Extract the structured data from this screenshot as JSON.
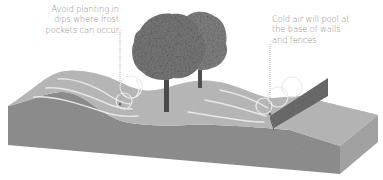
{
  "diagram": {
    "annotations": [
      {
        "id": "frost-pocket",
        "lines": [
          "Avoid planting in",
          "dips where frost",
          "pockets can occur"
        ]
      },
      {
        "id": "cold-air",
        "lines": [
          "Cold air will pool at",
          "the base of walls",
          "and fences"
        ]
      }
    ],
    "colors": {
      "background": "#ffffff",
      "ground_top": "#b9b9b9",
      "ground_front": "#8e8e8e",
      "ground_side": "#a4a4a4",
      "airflow_lines": "#e6e6e6",
      "wall_face": "#6f6f6f",
      "wall_top": "#8a8a8a",
      "leader_line": "#9a9a9a",
      "label_text": "#8c8c8c",
      "tree_foliage": "#7a7a7a",
      "tree_trunk": "#4a4a4a"
    }
  }
}
